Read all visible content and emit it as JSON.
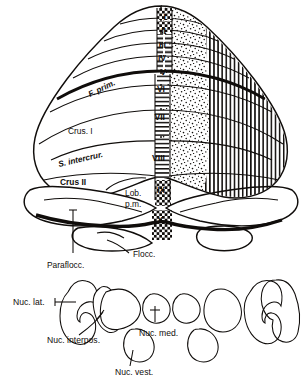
{
  "figure": {
    "kind": "anatomical-schematic"
  },
  "vermis_lobules": [
    {
      "id": "I",
      "label": "I"
    },
    {
      "id": "II",
      "label": "II"
    },
    {
      "id": "III",
      "label": "III"
    },
    {
      "id": "IV",
      "label": "IV"
    },
    {
      "id": "V",
      "label": "V"
    },
    {
      "id": "VI",
      "label": "VI"
    },
    {
      "id": "VII",
      "label": "VII"
    },
    {
      "id": "VIII",
      "label": "VIII"
    },
    {
      "id": "IX",
      "label": "IX"
    },
    {
      "id": "X",
      "label": "X"
    }
  ],
  "cortex_labels": [
    {
      "name": "fissura-prima",
      "label": "F. prim."
    },
    {
      "name": "crus-one",
      "label": "Crus. I"
    },
    {
      "name": "sulcus-intercruralis",
      "label": "S. intercrur."
    },
    {
      "name": "crus-two",
      "label": "Crus II"
    },
    {
      "name": "lobulus-paramedianus-line1",
      "label": "Lob."
    },
    {
      "name": "lobulus-paramedianus-line2",
      "label": "p.m."
    },
    {
      "name": "flocculus",
      "label": "Flocc."
    },
    {
      "name": "paraflocculus",
      "label": "Paraflocc."
    }
  ],
  "nuclei_labels": [
    {
      "name": "nucleus-lateralis",
      "label": "Nuc. lat."
    },
    {
      "name": "nucleus-interpositus",
      "label": "Nuc. interpos."
    },
    {
      "name": "nucleus-medialis",
      "label": "Nuc. med."
    },
    {
      "name": "nucleus-vestibularis",
      "label": "Nuc. vest."
    }
  ],
  "patterns": {
    "checker": {
      "name": "checkerboard",
      "meaning": "Nuc. vest."
    },
    "horizontal": {
      "name": "horizontal-stripes",
      "meaning": "Nuc. med."
    },
    "stipple": {
      "name": "stipple-dots",
      "meaning": "Nuc. interpos."
    },
    "vertical": {
      "name": "vertical-stripes",
      "meaning": "Nuc. lat."
    }
  },
  "colors": {
    "ink": "#100d0b",
    "paper": "#ffffff",
    "faint": "#b9b6b2"
  },
  "bottom_caption": ""
}
